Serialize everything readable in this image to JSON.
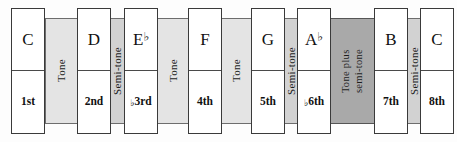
{
  "diagram": {
    "colors": {
      "note_fill": "#ffffff",
      "note_border": "#3a3a3a",
      "interval_light": "#e4e4e4",
      "interval_mid": "#d2d2d2",
      "interval_dark": "#a9a9a9",
      "background": "#fdfdfd"
    },
    "notes": [
      {
        "name": "C",
        "name_flat": false,
        "degree": "1st",
        "degree_flat": false
      },
      {
        "name": "D",
        "name_flat": false,
        "degree": "2nd",
        "degree_flat": false
      },
      {
        "name": "E",
        "name_flat": true,
        "degree": "3rd",
        "degree_flat": true
      },
      {
        "name": "F",
        "name_flat": false,
        "degree": "4th",
        "degree_flat": false
      },
      {
        "name": "G",
        "name_flat": false,
        "degree": "5th",
        "degree_flat": false
      },
      {
        "name": "A",
        "name_flat": true,
        "degree": "6th",
        "degree_flat": true
      },
      {
        "name": "B",
        "name_flat": false,
        "degree": "7th",
        "degree_flat": false
      },
      {
        "name": "C",
        "name_flat": false,
        "degree": "8th",
        "degree_flat": false
      }
    ],
    "intervals": [
      {
        "label": "Tone",
        "lines": [
          "Tone"
        ],
        "shade": "light"
      },
      {
        "label": "Semi-tone",
        "lines": [
          "Semi-tone"
        ],
        "shade": "mid"
      },
      {
        "label": "Tone",
        "lines": [
          "Tone"
        ],
        "shade": "light"
      },
      {
        "label": "Tone",
        "lines": [
          "Tone"
        ],
        "shade": "light"
      },
      {
        "label": "Semi-tone",
        "lines": [
          "Semi-tone"
        ],
        "shade": "mid"
      },
      {
        "label": "Tone plus semi-tone",
        "lines": [
          "Tone plus",
          "semi-tone"
        ],
        "shade": "dark"
      },
      {
        "label": "Semi-tone",
        "lines": [
          "Semi-tone"
        ],
        "shade": "mid"
      }
    ],
    "flat_glyph": "♭"
  }
}
